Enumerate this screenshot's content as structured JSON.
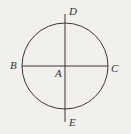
{
  "figure": {
    "background_color": "#f2f0ed",
    "stroke_color": "#3a3633",
    "label_color": "#332f2c",
    "circle": {
      "center_x": 65,
      "center_y": 66,
      "radius": 43
    },
    "horizontal_diameter": {
      "x1": 22,
      "y1": 66,
      "x2": 108,
      "y2": 66
    },
    "vertical_diameter": {
      "x1": 65,
      "y1": 14,
      "x2": 65,
      "y2": 122
    },
    "labels": {
      "top": "D",
      "left": "B",
      "center": "A",
      "right": "C",
      "bottom": "E"
    }
  }
}
